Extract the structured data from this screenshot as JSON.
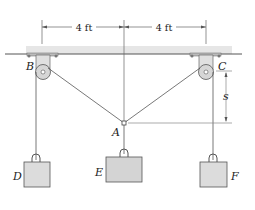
{
  "figure": {
    "dimensions": {
      "left_span": "4 ft",
      "right_span": "4 ft",
      "vertical": "s"
    },
    "points": {
      "B": "B",
      "C": "C",
      "A": "A"
    },
    "weights": {
      "D": "D",
      "E": "E",
      "F": "F"
    },
    "colors": {
      "line": "#555555",
      "ceiling_band": "#e2e2e2",
      "pulley_fill": "#d9d9d9",
      "weight_fill": "#dcdcdc",
      "weight_stroke": "#555555"
    }
  }
}
